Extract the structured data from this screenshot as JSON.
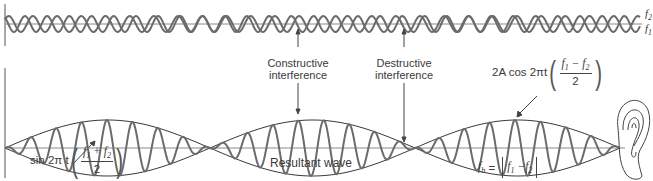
{
  "diagram": {
    "colors": {
      "wave": "#6b6b6b",
      "envelope": "#3a3a3a",
      "axis": "#555555",
      "baseline": "#8a8a8a",
      "text": "#3a3a3a"
    },
    "top_panel": {
      "labels": {
        "f2": "f",
        "f2_sub": "2",
        "f1": "f",
        "f1_sub": "1"
      }
    },
    "annotations": {
      "constructive_line1": "Constructive",
      "constructive_line2": "interference",
      "destructive_line1": "Destructive",
      "destructive_line2": "interference",
      "resultant": "Resultant wave"
    },
    "envelope_formula": {
      "prefix": "2A cos 2πt",
      "num_f1": "f",
      "num_f1_sub": "1",
      "minus": " − ",
      "num_f2": "f",
      "num_f2_sub": "2",
      "den": "2"
    },
    "carrier_formula": {
      "prefix": "sin 2π t",
      "num_f1": "f",
      "num_f1_sub": "1",
      "plus": " + ",
      "num_f2": "f",
      "num_f2_sub": "2",
      "den": "2"
    },
    "beat_formula": {
      "lhs": "f",
      "lhs_sub": "b",
      "eq": " = ",
      "f1": "f",
      "f1_sub": "1",
      "minus": " −",
      "f2": "f",
      "f2_sub": "2"
    },
    "icons": {
      "ear": "ear-icon"
    }
  }
}
